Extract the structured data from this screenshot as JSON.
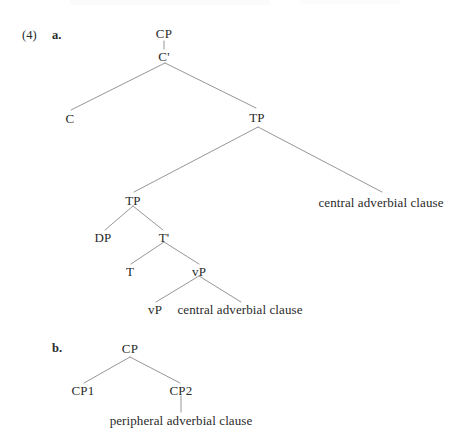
{
  "figure": {
    "item_number": "(4)",
    "sub_a_label": "a.",
    "sub_b_label": "b."
  },
  "tree_a": {
    "nodes": {
      "cp": "CP",
      "cbar": "C'",
      "c": "C",
      "tp_upper": "TP",
      "tp_lower": "TP",
      "dp": "DP",
      "tbar": "T'",
      "t": "T",
      "vp_upper": "vP",
      "vp_lower": "vP"
    },
    "adjuncts": {
      "tp_level": "central adverbial clause",
      "vp_level": "central adverbial clause"
    }
  },
  "tree_b": {
    "nodes": {
      "cp": "CP",
      "cp1": "CP1",
      "cp2": "CP2"
    },
    "adjuncts": {
      "cp2_complement": "peripheral adverbial clause"
    }
  },
  "style": {
    "line_color": "#8a8a8a",
    "text_color": "#2a2a2a",
    "background": "#ffffff"
  }
}
